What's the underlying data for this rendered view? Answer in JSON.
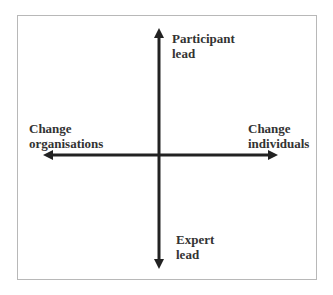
{
  "diagram": {
    "type": "quadrant-axes",
    "axes": {
      "vertical": {
        "top": {
          "line1": "Participant",
          "line2": "lead"
        },
        "bottom": {
          "line1": "Expert",
          "line2": "lead"
        }
      },
      "horizontal": {
        "left": {
          "line1": "Change",
          "line2": "organisations"
        },
        "right": {
          "line1": "Change",
          "line2": "individuals"
        }
      }
    },
    "colors": {
      "axis": "#222222",
      "text": "#333333",
      "frame": "#b8b8b8",
      "background": "#ffffff"
    }
  }
}
